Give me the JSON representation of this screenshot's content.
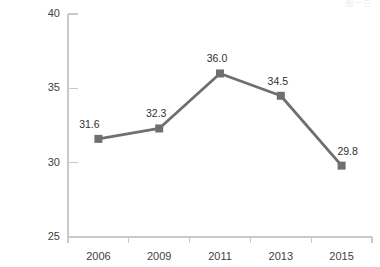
{
  "artifact_text": "图一三",
  "chart_data": {
    "type": "line",
    "title": "",
    "subtitle": "",
    "xlabel": "",
    "ylabel": "",
    "categories": [
      "2006",
      "2009",
      "2011",
      "2013",
      "2015"
    ],
    "values": [
      31.6,
      32.3,
      36.0,
      34.5,
      29.8
    ],
    "point_labels": [
      "31.6",
      "32.3",
      "36.0",
      "34.5",
      "29.8"
    ],
    "series": [
      {
        "name": "",
        "values": [
          31.6,
          32.3,
          36.0,
          34.5,
          29.8
        ]
      }
    ],
    "ylim": [
      25,
      40
    ],
    "yticks": [
      25,
      30,
      35,
      40
    ],
    "ytick_labels": [
      "25",
      "30",
      "35",
      "40"
    ],
    "grid": false,
    "legend": false,
    "legend_position": "none",
    "marker": "square",
    "colors": {
      "line": "#6f6f6f",
      "marker": "#6f6f6f",
      "axis": "#c9c9c9",
      "tick_text": "#3f3f3f",
      "label_text": "#2f2f2f",
      "background": "#ffffff"
    }
  }
}
